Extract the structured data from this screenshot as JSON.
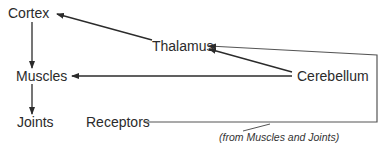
{
  "diagram": {
    "nodes": {
      "cortex": "Cortex",
      "thalamus": "Thalamus",
      "muscles": "Muscles",
      "cerebellum": "Cerebellum",
      "joints": "Joints",
      "receptors": "Receptors"
    },
    "caption": "(from Muscles and Joints)",
    "edges": [
      {
        "from": "Thalamus",
        "to": "Cortex"
      },
      {
        "from": "Cortex",
        "to": "Muscles"
      },
      {
        "from": "Muscles",
        "to": "Joints"
      },
      {
        "from": "Cerebellum",
        "to": "Muscles"
      },
      {
        "from": "Cerebellum",
        "to": "Thalamus"
      },
      {
        "from": "Receptors",
        "to": "Thalamus",
        "via": "right-side loop"
      }
    ],
    "line_color": "#2b2b2b",
    "loop_line_color": "#555555"
  }
}
